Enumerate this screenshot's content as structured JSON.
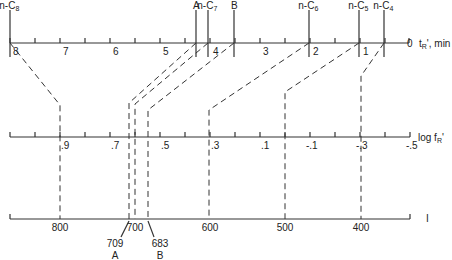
{
  "diagram": {
    "type": "nomogram",
    "axes": {
      "top": {
        "label": "t",
        "label_sub": "R",
        "label_suffix": "', min",
        "y": 43,
        "x_start": 10,
        "x_end": 409,
        "ticks": [
          {
            "x": 10,
            "label": "8"
          },
          {
            "x": 35,
            "label": ""
          },
          {
            "x": 60,
            "label": "7"
          },
          {
            "x": 85,
            "label": ""
          },
          {
            "x": 110,
            "label": "6"
          },
          {
            "x": 135,
            "label": ""
          },
          {
            "x": 160,
            "label": "5"
          },
          {
            "x": 185,
            "label": ""
          },
          {
            "x": 210,
            "label": "4"
          },
          {
            "x": 235,
            "label": ""
          },
          {
            "x": 260,
            "label": "3"
          },
          {
            "x": 285,
            "label": ""
          },
          {
            "x": 310,
            "label": "2"
          },
          {
            "x": 335,
            "label": ""
          },
          {
            "x": 360,
            "label": "1"
          },
          {
            "x": 385,
            "label": ""
          },
          {
            "x": 409,
            "label": "0"
          }
        ]
      },
      "middle": {
        "label": "log f",
        "label_sub": "R",
        "label_suffix": "'",
        "y": 137,
        "x_start": 10,
        "x_end": 410,
        "ticks": [
          {
            "x": 10,
            "label": ""
          },
          {
            "x": 35,
            "label": ""
          },
          {
            "x": 60,
            "label": ".9"
          },
          {
            "x": 85,
            "label": ""
          },
          {
            "x": 110,
            "label": ".7"
          },
          {
            "x": 135,
            "label": ""
          },
          {
            "x": 160,
            "label": ".5"
          },
          {
            "x": 185,
            "label": ""
          },
          {
            "x": 210,
            "label": ".3"
          },
          {
            "x": 235,
            "label": ""
          },
          {
            "x": 260,
            "label": ".1"
          },
          {
            "x": 285,
            "label": ""
          },
          {
            "x": 310,
            "label": "-.1"
          },
          {
            "x": 335,
            "label": ""
          },
          {
            "x": 360,
            "label": "-.3"
          },
          {
            "x": 385,
            "label": ""
          },
          {
            "x": 410,
            "label": "-.5"
          }
        ]
      },
      "bottom": {
        "label": "I",
        "y": 219,
        "x_start": 10,
        "x_end": 410,
        "ticks": [
          {
            "x": 60,
            "label": "800"
          },
          {
            "x": 135,
            "label": "700"
          },
          {
            "x": 210,
            "label": "600"
          },
          {
            "x": 285,
            "label": "500"
          },
          {
            "x": 361,
            "label": "400"
          }
        ]
      }
    },
    "markers": [
      {
        "name": "n-C8",
        "label": "n-C",
        "sub": "8",
        "x_top": 10,
        "x_mid": 60,
        "bend_y": 105,
        "t_R_min": 8.0
      },
      {
        "name": "A",
        "label": "A",
        "sub": "",
        "x_top": 196,
        "x_mid": 129,
        "bend_y": 103,
        "t_R_min": 4.3
      },
      {
        "name": "n-C7",
        "label": "n-C",
        "sub": "7",
        "x_top": 208,
        "x_mid": 135,
        "bend_y": 104,
        "t_R_min": 4.0
      },
      {
        "name": "B",
        "label": "B",
        "sub": "",
        "x_top": 234,
        "x_mid": 148,
        "bend_y": 110,
        "t_R_min": 3.5
      },
      {
        "name": "n-C6",
        "label": "n-C",
        "sub": "6",
        "x_top": 309,
        "x_mid": 209,
        "bend_y": 110,
        "t_R_min": 2.0
      },
      {
        "name": "n-C5",
        "label": "n-C",
        "sub": "5",
        "x_top": 359,
        "x_mid": 285,
        "bend_y": 92,
        "t_R_min": 1.0
      },
      {
        "name": "n-C4",
        "label": "n-C",
        "sub": "4",
        "x_top": 384,
        "x_mid": 361,
        "bend_y": 76,
        "t_R_min": 0.5
      }
    ],
    "annotations": [
      {
        "name": "A",
        "value": "709",
        "letter": "A",
        "x_target": 129,
        "label_x": 115
      },
      {
        "name": "B",
        "value": "683",
        "letter": "B",
        "x_target": 148,
        "label_x": 160
      }
    ]
  }
}
